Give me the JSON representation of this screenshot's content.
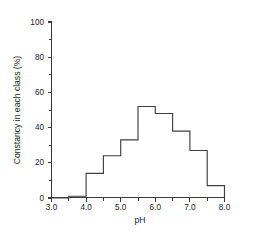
{
  "chart_data": {
    "type": "bar",
    "title": "",
    "subtitle": "",
    "xlabel": "pH",
    "ylabel": "Constancy in each class (%)",
    "xlim": [
      3.0,
      8.0
    ],
    "ylim": [
      0,
      100
    ],
    "grid": false,
    "legend": null,
    "bin_width": 0.5,
    "bin_edges": [
      3.0,
      3.5,
      4.0,
      4.5,
      5.0,
      5.5,
      6.0,
      6.5,
      7.0,
      7.5,
      8.0
    ],
    "categories": [
      "3.0-3.5",
      "3.5-4.0",
      "4.0-4.5",
      "4.5-5.0",
      "5.0-5.5",
      "5.5-6.0",
      "6.0-6.5",
      "6.5-7.0",
      "7.0-7.5",
      "7.5-8.0"
    ],
    "values": [
      0,
      1,
      14,
      24,
      33,
      52,
      48,
      38,
      27,
      7
    ],
    "x_ticks": [
      3.0,
      4.0,
      5.0,
      6.0,
      7.0,
      8.0
    ],
    "x_tick_labels": [
      "3.0",
      "4.0",
      "5.0",
      "6.0",
      "7.0",
      "8.0"
    ],
    "x_minor_ticks": [
      3.5,
      4.5,
      5.5,
      6.5,
      7.5
    ],
    "y_ticks": [
      0,
      20,
      40,
      60,
      80,
      100
    ],
    "y_tick_labels": [
      "0",
      "20",
      "40",
      "60",
      "80",
      "100"
    ],
    "y_minor_ticks": [
      10,
      30,
      50,
      70,
      90
    ],
    "line_color": "#404040",
    "axis_color": "#3a3a3a",
    "background_color": "#ffffff"
  },
  "axes": {
    "x_title": "pH",
    "y_title": "Constancy in each class (%)"
  },
  "y_tick_text": {
    "t0": "0",
    "t1": "20",
    "t2": "40",
    "t3": "60",
    "t4": "80",
    "t5": "100"
  },
  "x_tick_text": {
    "t0": "3.0",
    "t1": "4.0",
    "t2": "5.0",
    "t3": "6.0",
    "t4": "7.0",
    "t5": "8.0"
  }
}
